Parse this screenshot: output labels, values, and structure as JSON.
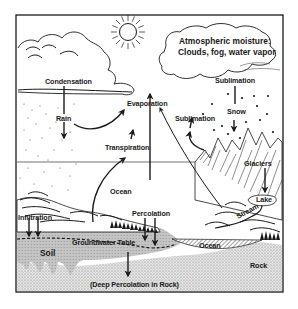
{
  "diagram": {
    "frame": {
      "x": 16,
      "y": 15,
      "width": 267,
      "height": 277
    },
    "colors": {
      "ink": "#1a1a1a",
      "soil": "#c8c8c8",
      "rock": "#e2e2e2",
      "background": "#ffffff"
    },
    "labels": {
      "atmospheric_1": "Atmospheric moisture:",
      "atmospheric_2": "Clouds, fog, water vapor",
      "condensation": "Condensation",
      "rain": "Rain",
      "evaporation": "Evaporation",
      "transpiration": "Transpiration",
      "sublimation_top": "Sublimation",
      "sublimation_mid": "Sublimation",
      "snow": "Snow",
      "glaciers": "Glaciers",
      "lake": "Lake",
      "stream": "Stream",
      "ocean_main": "Ocean",
      "ocean_small": "Ocean",
      "infiltration": "Infiltration",
      "percolation": "Percolation",
      "groundwater_table": "Groundwater Table",
      "soil": "Soil",
      "rock": "Rock",
      "deep_percolation": "(Deep Percolation in Rock)"
    },
    "icons": [
      "sun-icon",
      "cloud-icon",
      "mountain-icon",
      "tree-icon",
      "arrow-icon",
      "snowflake-icon"
    ]
  }
}
